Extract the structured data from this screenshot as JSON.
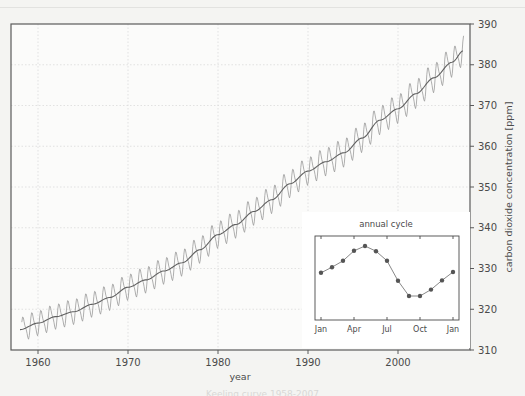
{
  "figure": {
    "background_color": "#f4f4f2",
    "plot_background_color": "#fbfbfa",
    "frame_color": "#5a5a5a",
    "grid_color": "#dcdcda",
    "data_line_color": "#9a9a9a",
    "trend_line_color": "#606060",
    "marker_color": "#555555",
    "caption_partial": "Keeling curve 1958-2007"
  },
  "chart_data": {
    "type": "line",
    "title": "",
    "xlabel": "year",
    "ylabel": "carbon dioxide concentration [ppm]",
    "xlim": [
      1957.0,
      2008.0
    ],
    "ylim": [
      310,
      390
    ],
    "xticks": [
      1960,
      1970,
      1980,
      1990,
      2000
    ],
    "yticks": [
      310,
      320,
      330,
      340,
      350,
      360,
      370,
      380,
      390
    ],
    "y_axis_position": "right",
    "grid": true,
    "legend": "none",
    "series": [
      {
        "name": "monthly mean CO2",
        "style": "sawtooth",
        "color": "#9a9a9a",
        "x": [
          1958.2,
          1958.5,
          1958.8,
          1959.0,
          1959.3,
          1959.5,
          1959.8,
          1960.0,
          1960.3,
          1960.5,
          1960.8,
          1961.0,
          1961.3,
          1961.5,
          1961.8,
          1962.0,
          1962.3,
          1962.5,
          1962.8,
          1963.0,
          1963.3,
          1963.5,
          1963.8,
          1964.0,
          1964.3,
          1964.5,
          1964.8,
          1965.0,
          1965.3,
          1965.5,
          1965.8,
          1966.0,
          1966.3,
          1966.5,
          1966.8,
          1967.0,
          1967.3,
          1967.5,
          1967.8,
          1968.0,
          1968.3,
          1968.5,
          1968.8,
          1969.0,
          1969.3,
          1969.5,
          1969.8,
          1970.0,
          1970.3,
          1970.5,
          1970.8,
          1971.0,
          1971.3,
          1971.5,
          1971.8,
          1972.0,
          1972.3,
          1972.5,
          1972.8,
          1973.0,
          1973.3,
          1973.5,
          1973.8,
          1974.0,
          1974.3,
          1974.5,
          1974.8,
          1975.0,
          1975.3,
          1975.5,
          1975.8,
          1976.0,
          1976.3,
          1976.5,
          1976.8,
          1977.0,
          1977.3,
          1977.5,
          1977.8,
          1978.0,
          1978.3,
          1978.5,
          1978.8,
          1979.0,
          1979.3,
          1979.5,
          1979.8,
          1980.0,
          1980.3,
          1980.5,
          1980.8,
          1981.0,
          1981.3,
          1981.5,
          1981.8,
          1982.0,
          1982.3,
          1982.5,
          1982.8,
          1983.0,
          1983.3,
          1983.5,
          1983.8,
          1984.0,
          1984.3,
          1984.5,
          1984.8,
          1985.0,
          1985.3,
          1985.5,
          1985.8,
          1986.0,
          1986.3,
          1986.5,
          1986.8,
          1987.0,
          1987.3,
          1987.5,
          1987.8,
          1988.0,
          1988.3,
          1988.5,
          1988.8,
          1989.0,
          1989.3,
          1989.5,
          1989.8,
          1990.0,
          1990.3,
          1990.5,
          1990.8,
          1991.0,
          1991.3,
          1991.5,
          1991.8,
          1992.0,
          1992.3,
          1992.5,
          1992.8,
          1993.0,
          1993.3,
          1993.5,
          1993.8,
          1994.0,
          1994.3,
          1994.5,
          1994.8,
          1995.0,
          1995.3,
          1995.5,
          1995.8,
          1996.0,
          1996.3,
          1996.5,
          1996.8,
          1997.0,
          1997.3,
          1997.5,
          1997.8,
          1998.0,
          1998.3,
          1998.5,
          1998.8,
          1999.0,
          1999.3,
          1999.5,
          1999.8,
          2000.0,
          2000.3,
          2000.5,
          2000.8,
          2001.0,
          2001.3,
          2001.5,
          2001.8,
          2002.0,
          2002.3,
          2002.5,
          2002.8,
          2003.0,
          2003.3,
          2003.5,
          2003.8,
          2004.0,
          2004.3,
          2004.5,
          2004.8,
          2005.0,
          2005.3,
          2005.5,
          2005.8,
          2006.0,
          2006.3,
          2006.5,
          2006.8,
          2007.0,
          2007.3
        ],
        "note": "monthly oscillation of about 6 ppm peak-to-trough superimposed on rising trend"
      },
      {
        "name": "smoothed trend",
        "style": "smooth",
        "color": "#606060",
        "x": [
          1958,
          1960,
          1962,
          1964,
          1966,
          1968,
          1970,
          1972,
          1974,
          1976,
          1978,
          1980,
          1982,
          1984,
          1986,
          1988,
          1990,
          1992,
          1994,
          1996,
          1998,
          2000,
          2002,
          2004,
          2006,
          2007.3
        ],
        "y": [
          315.0,
          316.6,
          318.2,
          319.4,
          321.2,
          322.9,
          325.4,
          327.2,
          329.4,
          331.4,
          334.6,
          338.3,
          340.8,
          344.0,
          346.9,
          350.8,
          353.9,
          356.2,
          358.4,
          362.0,
          366.4,
          369.2,
          372.9,
          376.8,
          380.6,
          383.5
        ]
      }
    ],
    "inset": {
      "title": "annual cycle",
      "type": "line",
      "marker": "circle",
      "xticks": [
        "Jan",
        "Apr",
        "Jul",
        "Oct",
        "Jan"
      ],
      "ylim": [
        316,
        337
      ],
      "categories": [
        "Jan",
        "Feb",
        "Mar",
        "Apr",
        "May",
        "Jun",
        "Jul",
        "Aug",
        "Sep",
        "Oct",
        "Nov",
        "Dec",
        "Jan"
      ],
      "values": [
        327.8,
        329.2,
        330.8,
        333.3,
        334.5,
        333.2,
        330.8,
        325.8,
        322.0,
        322.0,
        323.6,
        325.9,
        328.0
      ],
      "xlabel": "",
      "ylabel": ""
    }
  }
}
